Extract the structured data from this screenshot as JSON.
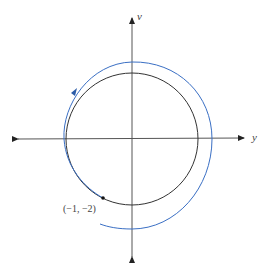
{
  "diagram": {
    "type": "phase-plane",
    "axes": {
      "horizontal_label": "y",
      "vertical_label": "v",
      "origin": [
        132,
        139
      ]
    },
    "circle": {
      "center": [
        132,
        139
      ],
      "radius": 66,
      "color": "#333333"
    },
    "spiral": {
      "color": "#3a6fc4",
      "direction": "clockwise"
    },
    "point": {
      "label": "(−1, −2)",
      "position": [
        103,
        198
      ]
    },
    "colors": {
      "axis": "#222222",
      "circle": "#333333",
      "spiral": "#3a6fc4"
    }
  }
}
